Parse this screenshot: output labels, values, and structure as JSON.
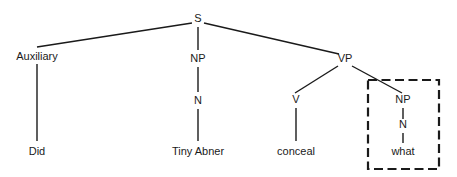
{
  "figure": {
    "type": "syntax-tree-diagram",
    "sentence": "Did Tiny Abner conceal what",
    "background_color": "#ffffff",
    "line_color": "#1a1a1a",
    "highlight_color": "#1a1a1a"
  },
  "nodes": {
    "s": {
      "label": "S",
      "x": 198,
      "y": 22
    },
    "auxiliary": {
      "label": "Auxiliary",
      "x": 37,
      "y": 60
    },
    "np_subject": {
      "label": "NP",
      "x": 198,
      "y": 62
    },
    "vp": {
      "label": "VP",
      "x": 345,
      "y": 62
    },
    "n_subject": {
      "label": "N",
      "x": 198,
      "y": 104
    },
    "v": {
      "label": "V",
      "x": 296,
      "y": 103
    },
    "np_object": {
      "label": "NP",
      "x": 403,
      "y": 103
    },
    "n_object": {
      "label": "N",
      "x": 403,
      "y": 128
    }
  },
  "leaves": {
    "aux_word": {
      "label": "Did",
      "x": 37,
      "y": 155
    },
    "subject_words": {
      "label": "Tiny Abner",
      "x": 198,
      "y": 155
    },
    "verb_word": {
      "label": "conceal",
      "x": 296,
      "y": 155
    },
    "object_word": {
      "label": "what",
      "x": 403,
      "y": 155
    }
  },
  "edges": [
    {
      "name": "s-to-auxiliary",
      "x1": 192,
      "y1": 23,
      "x2": 37,
      "y2": 47
    },
    {
      "name": "s-to-np-subject",
      "x1": 198,
      "y1": 27,
      "x2": 198,
      "y2": 50
    },
    {
      "name": "s-to-vp",
      "x1": 204,
      "y1": 23,
      "x2": 339,
      "y2": 54
    },
    {
      "name": "auxiliary-to-did",
      "x1": 37,
      "y1": 64,
      "x2": 37,
      "y2": 141
    },
    {
      "name": "np-subject-to-n",
      "x1": 198,
      "y1": 67,
      "x2": 198,
      "y2": 92
    },
    {
      "name": "n-to-tiny-abner",
      "x1": 198,
      "y1": 109,
      "x2": 198,
      "y2": 141
    },
    {
      "name": "vp-to-v",
      "x1": 338,
      "y1": 66,
      "x2": 295,
      "y2": 93
    },
    {
      "name": "vp-to-np-object",
      "x1": 352,
      "y1": 66,
      "x2": 402,
      "y2": 93
    },
    {
      "name": "v-to-conceal",
      "x1": 296,
      "y1": 108,
      "x2": 296,
      "y2": 141
    },
    {
      "name": "np-object-to-n",
      "x1": 403,
      "y1": 108,
      "x2": 403,
      "y2": 119
    },
    {
      "name": "n-to-what",
      "x1": 403,
      "y1": 133,
      "x2": 403,
      "y2": 143
    }
  ],
  "highlight_box": {
    "name": "object-np-highlight",
    "x": 368,
    "y": 80,
    "width": 71,
    "height": 89,
    "dash": "9 4.5"
  }
}
